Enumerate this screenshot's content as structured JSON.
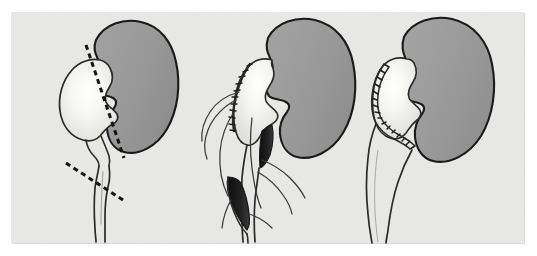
{
  "figure": {
    "title": "Dismembered pyeloplasty of the ureteropelvic junction",
    "medium": "line-and-wash medical illustration",
    "panel_count": 3,
    "caption": ""
  },
  "canvas": {
    "width": 537,
    "height": 256,
    "outer_background": "#ffffff",
    "plate_background": "#e8e8e6",
    "plate_rect": {
      "x": 11,
      "y": 12,
      "width": 513,
      "height": 231
    }
  },
  "palette": {
    "kidney_fill": "#9a9a9a",
    "kidney_fill_dark": "#8d8d8d",
    "kidney_outline": "#1a1a1a",
    "pelvis_fill": "#ededea",
    "pelvis_highlight": "#fdfdfc",
    "pelvis_outline": "#2a2a2a",
    "ureter_outline": "#2a2a2a",
    "lumen_dark": "#1b1b1b",
    "suture_color": "#2b2b2b",
    "dash_color": "#141414",
    "plate_shadow": "#d9d9d6"
  },
  "panels": [
    {
      "id": "panel-a",
      "label": "A",
      "label_visible": false,
      "stage": "preoperative",
      "description": "Hydronephrotic kidney with dilated renal pelvis; dashed lines mark the planned excision of the redundant pelvis and the oblique transection of the proximal ureter below the stenotic ureteropelvic junction.",
      "origin_x": 18,
      "features": [
        {
          "name": "kidney-parenchyma",
          "present": true
        },
        {
          "name": "dilated-renal-pelvis",
          "present": true
        },
        {
          "name": "proximal-ureter",
          "present": true
        },
        {
          "name": "upj-stenosis",
          "present": true
        },
        {
          "name": "pelvic-incision-dashed-line",
          "present": true
        },
        {
          "name": "ureteric-transection-dashed-line",
          "present": true
        }
      ]
    },
    {
      "id": "panel-b",
      "label": "B",
      "label_visible": false,
      "stage": "intraoperative",
      "description": "Redundant pelvis has been excised and closed with a running suture; the ureter is spatulated along its lateral wall exposing the open lumen, with stay sutures held on long trailing threads.",
      "origin_x": 190,
      "features": [
        {
          "name": "kidney-parenchyma",
          "present": true
        },
        {
          "name": "reduced-renal-pelvis",
          "present": true
        },
        {
          "name": "running-suture-line",
          "present": true
        },
        {
          "name": "spatulated-ureter",
          "present": true
        },
        {
          "name": "open-ureteric-lumen",
          "present": true
        },
        {
          "name": "trailing-suture-threads",
          "present": true
        }
      ]
    },
    {
      "id": "panel-c",
      "label": "C",
      "label_visible": false,
      "stage": "postoperative",
      "description": "Completed funnel-shaped ureteropelvic anastomosis; the interrupted suture line runs down the lateral pelvic margin and around onto the spatulated ureter, restoring a wide dependent drainage channel.",
      "origin_x": 362,
      "features": [
        {
          "name": "kidney-parenchyma",
          "present": true
        },
        {
          "name": "remodelled-renal-pelvis",
          "present": true
        },
        {
          "name": "completed-anastomosis-suture-line",
          "present": true
        },
        {
          "name": "reconstructed-ureter",
          "present": true
        }
      ]
    }
  ],
  "annotations": {
    "dashed_lines": [
      {
        "name": "pelvis-excision-line",
        "panel": "panel-a",
        "dash_length": 5,
        "gap_length": 4,
        "stroke_width": 3,
        "from": {
          "x": 86,
          "y": 45
        },
        "to": {
          "x": 124,
          "y": 158
        }
      },
      {
        "name": "ureter-transection-line",
        "panel": "panel-a",
        "dash_length": 5,
        "gap_length": 4,
        "stroke_width": 3,
        "from": {
          "x": 66,
          "y": 163
        },
        "to": {
          "x": 126,
          "y": 202
        }
      }
    ]
  }
}
